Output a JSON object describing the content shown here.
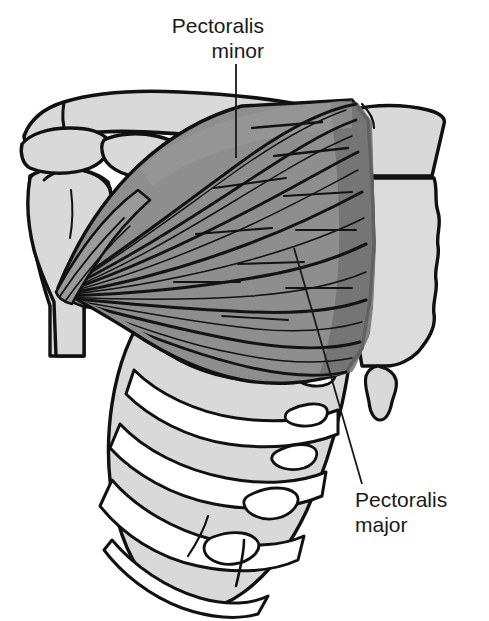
{
  "figure": {
    "background_color": "#ffffff",
    "width": 489,
    "height": 621
  },
  "labels": [
    {
      "id": "pectoralis-minor",
      "line1": "Pectoralis",
      "line2": "minor",
      "align": "right",
      "leader": "vertical line from text down into muscle"
    },
    {
      "id": "pectoralis-major",
      "line1": "Pectoralis",
      "line2": "major",
      "align": "left",
      "leader": "diagonal line from text up-left into muscle"
    }
  ],
  "label_pectoralis_minor": {
    "line1": "Pectoralis",
    "line2": "minor"
  },
  "label_pectoralis_major": {
    "line1": "Pectoralis",
    "line2": "major"
  },
  "colors": {
    "background": "#ffffff",
    "outline": "#111111",
    "bone_fill": "#d9d9d9",
    "bone_fill_light": "#e2e2e2",
    "cartilage_fill": "#ffffff",
    "muscle_major_fill": "#8e8e8e",
    "muscle_major_shadow": "#6e6e6e",
    "muscle_minor_fill": "#7a7a7a",
    "muscle_tendon_fill": "#9a9a9a",
    "label_text": "#1a1a1a",
    "leader_line": "#1a1a1a"
  },
  "structures": [
    {
      "name": "clavicle",
      "type": "bone"
    },
    {
      "name": "acromion",
      "type": "bone"
    },
    {
      "name": "coracoid-process",
      "type": "bone"
    },
    {
      "name": "scapula",
      "type": "bone"
    },
    {
      "name": "humerus",
      "type": "bone"
    },
    {
      "name": "sternum-manubrium",
      "type": "bone"
    },
    {
      "name": "sternum-body",
      "type": "bone"
    },
    {
      "name": "xiphoid-process",
      "type": "bone"
    },
    {
      "name": "ribs",
      "type": "bone"
    },
    {
      "name": "costal-cartilages",
      "type": "cartilage"
    },
    {
      "name": "pectoralis-major",
      "type": "muscle"
    },
    {
      "name": "pectoralis-minor",
      "type": "muscle"
    }
  ]
}
